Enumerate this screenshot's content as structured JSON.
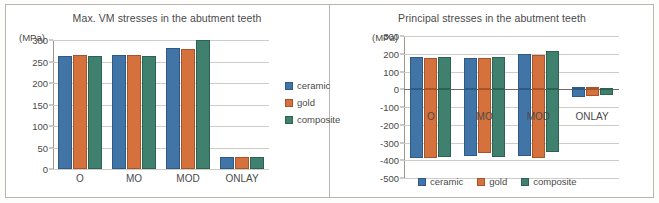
{
  "figure": {
    "panels": [
      "left",
      "right"
    ]
  },
  "chart_data": [
    {
      "type": "bar",
      "id": "max-vm-stresses",
      "title": "Max. VM stresses in the abutment teeth",
      "unit_label": "(MPa)",
      "xlabel": "",
      "ylabel": "",
      "categories": [
        "O",
        "MO",
        "MOD",
        "ONLAY"
      ],
      "series": [
        {
          "name": "ceramic",
          "color": "#4275a7",
          "values": [
            263,
            264,
            281,
            28
          ]
        },
        {
          "name": "gold",
          "color": "#d4713c",
          "values": [
            264,
            264,
            280,
            27
          ]
        },
        {
          "name": "composite",
          "color": "#3f806f",
          "values": [
            262,
            263,
            299,
            27
          ]
        }
      ],
      "ylim": [
        0,
        300
      ],
      "yticks": [
        0,
        50,
        100,
        150,
        200,
        250,
        300
      ],
      "ytick_labels": [
        "0",
        "50",
        "100",
        "150",
        "200",
        "250",
        "300"
      ],
      "grid": true,
      "legend_position": "right"
    },
    {
      "type": "bar",
      "id": "principal-stresses",
      "title": "Principal stresses in the abutment teeth",
      "unit_label": "(MPa)",
      "xlabel": "",
      "ylabel": "",
      "categories": [
        "O",
        "MO",
        "MOD",
        "ONLAY"
      ],
      "series": [
        {
          "name": "ceramic",
          "color": "#4275a7",
          "positive": [
            180,
            177,
            196,
            11
          ],
          "negative": [
            -385,
            -377,
            -376,
            -42
          ]
        },
        {
          "name": "gold",
          "color": "#d4713c",
          "positive": [
            178,
            176,
            194,
            10
          ],
          "negative": [
            -385,
            -360,
            -385,
            -38
          ]
        },
        {
          "name": "composite",
          "color": "#3f806f",
          "positive": [
            184,
            184,
            215,
            9
          ],
          "negative": [
            -384,
            -383,
            -352,
            -33
          ]
        }
      ],
      "ylim": [
        -500,
        300
      ],
      "yticks": [
        -500,
        -400,
        -300,
        -200,
        -100,
        0,
        100,
        200,
        300
      ],
      "ytick_labels": [
        "-500",
        "-400",
        "-300",
        "-200",
        "-100",
        "0",
        "100",
        "200",
        "300"
      ],
      "grid": true,
      "legend_position": "bottom"
    }
  ]
}
